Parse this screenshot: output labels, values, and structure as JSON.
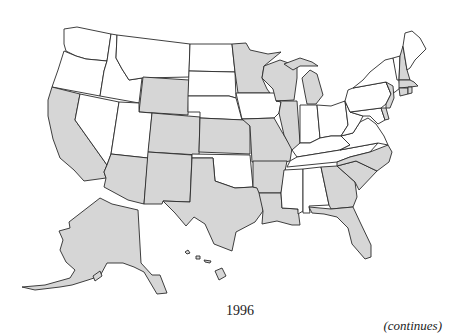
{
  "figure": {
    "year_label": "1996",
    "continues_label": "(continues)",
    "shade_color": "#d6d6d6",
    "unshaded_color": "#ffffff",
    "border_color": "#2a2a2a"
  },
  "states": {
    "shaded": [
      "CA",
      "WY",
      "CO",
      "AZ",
      "NM",
      "KS",
      "TX",
      "MN",
      "MO",
      "AR",
      "LA",
      "WI",
      "IL",
      "MI",
      "GA",
      "FL",
      "SC",
      "NC",
      "NH",
      "MA",
      "CT",
      "RI",
      "NJ",
      "DE",
      "AK",
      "HI"
    ],
    "unshaded": [
      "WA",
      "OR",
      "NV",
      "ID",
      "MT",
      "UT",
      "ND",
      "SD",
      "NE",
      "OK",
      "IA",
      "IN",
      "OH",
      "KY",
      "TN",
      "MS",
      "AL",
      "VA",
      "WV",
      "PA",
      "NY",
      "ME",
      "VT",
      "MD"
    ]
  }
}
